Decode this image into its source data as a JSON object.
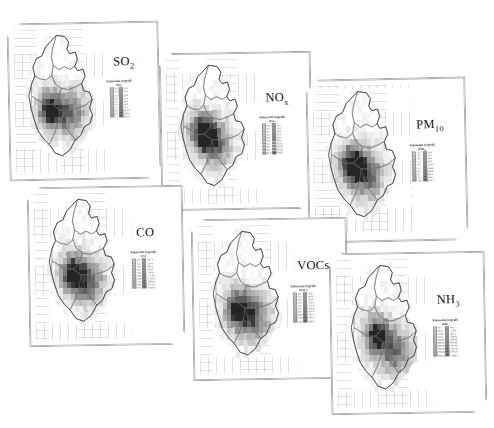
{
  "figure": {
    "kind": "multi-panel-choropleth-map-figure",
    "panel_count": 6,
    "background_color": "#ffffff",
    "panel_border_color": "#a8a8a8",
    "colormap": "grayscale-sequential-light-to-dark",
    "grid_visible": true
  },
  "chart_data": {
    "type": "heatmap",
    "title": "",
    "xlabel": "",
    "ylabel": "",
    "legend_position": "right-of-map, inside panel",
    "panels": [
      {
        "id": "so2",
        "species_label": "SO",
        "species_sub": "2",
        "legend_title_line1": "Emission (t/grid)",
        "legend_title_line2": "SO₂",
        "legend_classes": 20,
        "legend_labels_left": [
          "0.0",
          "0.1",
          "0.3",
          "0.6",
          "1.0",
          "1.6",
          "2.4",
          "3.5",
          "5.0",
          "7.1"
        ],
        "legend_labels_right": [
          "10.0",
          "14.1",
          "19.8",
          "27.6",
          "38.3",
          "53.0",
          "73.2",
          "101.0",
          "139.1",
          "191.3"
        ],
        "map_dark_cells": 5,
        "max_class_value": 191.3
      },
      {
        "id": "nox",
        "species_label": "NO",
        "species_sub": "x",
        "legend_title_line1": "Emission (t/grid)",
        "legend_title_line2": "NOₓ",
        "legend_classes": 20,
        "legend_labels_left": [
          "0.0",
          "0.2",
          "0.5",
          "1.0",
          "1.8",
          "2.9",
          "4.4",
          "6.5",
          "9.4",
          "13.3"
        ],
        "legend_labels_right": [
          "18.7",
          "26.1",
          "36.3",
          "50.4",
          "69.8",
          "96.5",
          "133.3",
          "184.0",
          "253.8",
          "349.9"
        ],
        "map_dark_cells": 6,
        "max_class_value": 349.9
      },
      {
        "id": "pm10",
        "species_label": "PM",
        "species_sub": "10",
        "legend_title_line1": "Emission (t/grid)",
        "legend_title_line2": "PM₁₀",
        "legend_classes": 20,
        "legend_labels_left": [
          "0.0",
          "0.3",
          "0.8",
          "1.5",
          "2.6",
          "4.2",
          "6.5",
          "9.7",
          "14.2",
          "20.5"
        ],
        "legend_labels_right": [
          "29.3",
          "41.6",
          "58.8",
          "82.9",
          "116.6",
          "163.8",
          "229.9",
          "322.5",
          "452.4",
          "634.4"
        ],
        "map_dark_cells": 8,
        "max_class_value": 634.4
      },
      {
        "id": "co",
        "species_label": "CO",
        "species_sub": "",
        "legend_title_line1": "Emission (t/grid)",
        "legend_title_line2": "CO",
        "legend_classes": 20,
        "legend_labels_left": [
          "0.0",
          "1.2",
          "3.0",
          "5.8",
          "10.1",
          "16.6",
          "26.4",
          "41.2",
          "63.5",
          "97.1"
        ],
        "legend_labels_right": [
          "147.8",
          "224.4",
          "340.2",
          "515.3",
          "779.8",
          "1,179.6",
          "1,783.5",
          "2,695.8",
          "4,073.9",
          "6,155.3"
        ],
        "map_dark_cells": 3,
        "max_class_value": 6155.3
      },
      {
        "id": "vocs",
        "species_label": "VOCs",
        "species_sub": "",
        "legend_title_line1": "Emission (t/grid)",
        "legend_title_line2": "VOCs",
        "legend_classes": 20,
        "legend_labels_left": [
          "0.0",
          "0.4",
          "1.0",
          "2.0",
          "3.4",
          "5.5",
          "8.6",
          "13.0",
          "19.3",
          "28.2"
        ],
        "legend_labels_right": [
          "40.8",
          "58.6",
          "83.8",
          "119.5",
          "170.1",
          "241.8",
          "343.4",
          "487.4",
          "691.3",
          "980.0"
        ],
        "map_dark_cells": 7,
        "max_class_value": 980.0
      },
      {
        "id": "nh3",
        "species_label": "NH",
        "species_sub": "3",
        "legend_title_line1": "Emission (t/grid)",
        "legend_title_line2": "NH₃",
        "legend_classes": 20,
        "legend_labels_left": [
          "0.0",
          "46.37",
          "72.66",
          "213.1",
          "305.81",
          "366.62",
          "494.89",
          "591.48",
          "768.18",
          "936.28"
        ],
        "legend_labels_right": [
          "46.37",
          "72.66",
          "213.1",
          "305.81",
          "366.62",
          "494.89",
          "591.48",
          "768.18",
          "936.28",
          "1,068.0"
        ],
        "map_dark_cells": 9,
        "max_class_value": 1068.0
      }
    ],
    "greyscale_ramp": [
      "#ffffff",
      "#f7f7f7",
      "#f0f0f0",
      "#e8e8e8",
      "#e0e0e0",
      "#d8d8d8",
      "#d0d0d0",
      "#c6c6c6",
      "#bcbcbc",
      "#b2b2b2",
      "#a8a8a8",
      "#9d9d9d",
      "#929292",
      "#858585",
      "#787878",
      "#6a6a6a",
      "#5c5c5c",
      "#4c4c4c",
      "#3a3a3a",
      "#252525"
    ]
  }
}
